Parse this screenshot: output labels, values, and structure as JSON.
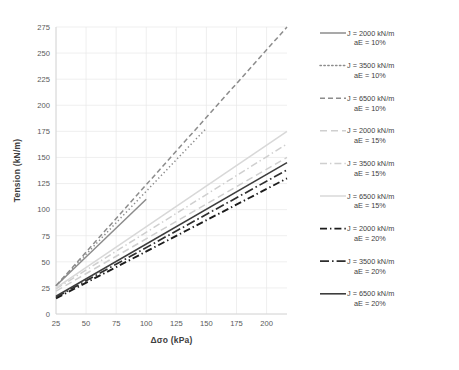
{
  "chart_data": {
    "type": "line",
    "title": "",
    "xlabel": "Δσo (kPa)",
    "ylabel": "Tension (kN/m)",
    "xlim": [
      25,
      217
    ],
    "ylim": [
      0,
      275
    ],
    "xticks": [
      25,
      50,
      75,
      100,
      125,
      150,
      175,
      200
    ],
    "yticks": [
      0,
      25,
      50,
      75,
      100,
      125,
      150,
      175,
      200,
      225,
      250,
      275
    ],
    "grid": true,
    "legend_position": "right",
    "series": [
      {
        "name": "J = 2000 kN/m aE = 10%",
        "label_line1": "J = 2000 kN/m",
        "label_line2": "aE = 10%",
        "J": 2000,
        "aE": "10%",
        "style": "solid",
        "color": "#8c8c8c",
        "width": 1.5,
        "x": [
          25,
          100
        ],
        "y": [
          27,
          110
        ]
      },
      {
        "name": "J = 3500 kN/m aE = 10%",
        "label_line1": "J = 3500 kN/m",
        "label_line2": "aE = 10%",
        "J": 3500,
        "aE": "10%",
        "style": "dotted",
        "color": "#8c8c8c",
        "width": 1.5,
        "x": [
          25,
          150
        ],
        "y": [
          27,
          178
        ]
      },
      {
        "name": "J = 6500 kN/m aE = 10%",
        "label_line1": "J = 6500 kN/m",
        "label_line2": "aE = 10%",
        "J": 6500,
        "aE": "10%",
        "style": "dashed",
        "color": "#8c8c8c",
        "width": 1.5,
        "x": [
          25,
          217
        ],
        "y": [
          27,
          275
        ]
      },
      {
        "name": "J = 2000 kN/m aE = 15%",
        "label_line1": "J = 2000 kN/m",
        "label_line2": "aE = 15%",
        "J": 2000,
        "aE": "15%",
        "style": "dashed-long",
        "color": "#cfcfcf",
        "width": 1.5,
        "x": [
          25,
          217
        ],
        "y": [
          22,
          150
        ]
      },
      {
        "name": "J = 3500 kN/m aE = 15%",
        "label_line1": "J = 3500 kN/m",
        "label_line2": "aE = 15%",
        "J": 3500,
        "aE": "15%",
        "style": "dash-dot",
        "color": "#cfcfcf",
        "width": 1.5,
        "x": [
          25,
          217
        ],
        "y": [
          24,
          163
        ]
      },
      {
        "name": "J = 6500 kN/m aE = 15%",
        "label_line1": "J = 6500 kN/m",
        "label_line2": "aE = 15%",
        "J": 6500,
        "aE": "15%",
        "style": "solid",
        "color": "#d8d8d8",
        "width": 1.5,
        "x": [
          25,
          217
        ],
        "y": [
          25,
          175
        ]
      },
      {
        "name": "J = 2000 kN/m aE = 20%",
        "label_line1": "J = 2000 kN/m",
        "label_line2": "aE = 20%",
        "J": 2000,
        "aE": "20%",
        "style": "dash-dot",
        "color": "#1c1c1c",
        "width": 1.9,
        "x": [
          25,
          217
        ],
        "y": [
          15,
          130
        ]
      },
      {
        "name": "J = 3500 kN/m aE = 20%",
        "label_line1": "J = 3500 kN/m",
        "label_line2": "aE = 20%",
        "J": 3500,
        "aE": "20%",
        "style": "dash-dot-long",
        "color": "#2e2e2e",
        "width": 1.7,
        "x": [
          25,
          217
        ],
        "y": [
          16,
          138
        ]
      },
      {
        "name": "J = 6500 kN/m aE = 20%",
        "label_line1": "J = 6500 kN/m",
        "label_line2": "aE = 20%",
        "J": 6500,
        "aE": "20%",
        "style": "solid",
        "color": "#3d3d3d",
        "width": 1.6,
        "x": [
          25,
          217
        ],
        "y": [
          17,
          145
        ]
      }
    ]
  }
}
